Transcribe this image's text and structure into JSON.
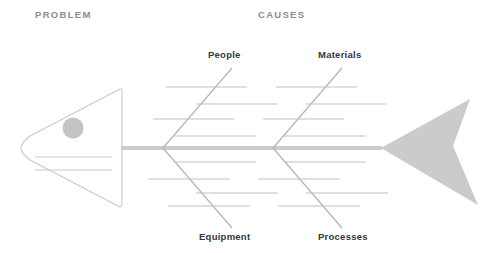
{
  "diagram": {
    "type": "fishbone-ishikawa",
    "title_left": "PROBLEM",
    "title_right": "CAUSES",
    "colors": {
      "header_text": "#8d8d8d",
      "label_text": "#33383d",
      "outline": "#c9c9c9",
      "spine": "#cccccc",
      "bone": "#b4b4b4",
      "subbone": "#c2c2c2",
      "tail_fill": "#cbcbcb",
      "eye_fill": "#c4c4c4",
      "background": "#ffffff"
    }
  },
  "headers": {
    "problem": "PROBLEM",
    "causes": "CAUSES"
  },
  "categories": [
    {
      "id": "people",
      "label": "People",
      "position": "upper-left",
      "sub_bone_count": 4
    },
    {
      "id": "materials",
      "label": "Materials",
      "position": "upper-right",
      "sub_bone_count": 4
    },
    {
      "id": "equipment",
      "label": "Equipment",
      "position": "lower-left",
      "sub_bone_count": 4
    },
    {
      "id": "processes",
      "label": "Processes",
      "position": "lower-right",
      "sub_bone_count": 4
    }
  ],
  "fish": {
    "head": {
      "shape": "rounded-triangle-pointing-left",
      "eye": "filled-circle",
      "detail_lines": 2
    },
    "spine": {
      "orientation": "horizontal"
    },
    "tail": {
      "shape": "filled-chevron-arrow"
    }
  }
}
